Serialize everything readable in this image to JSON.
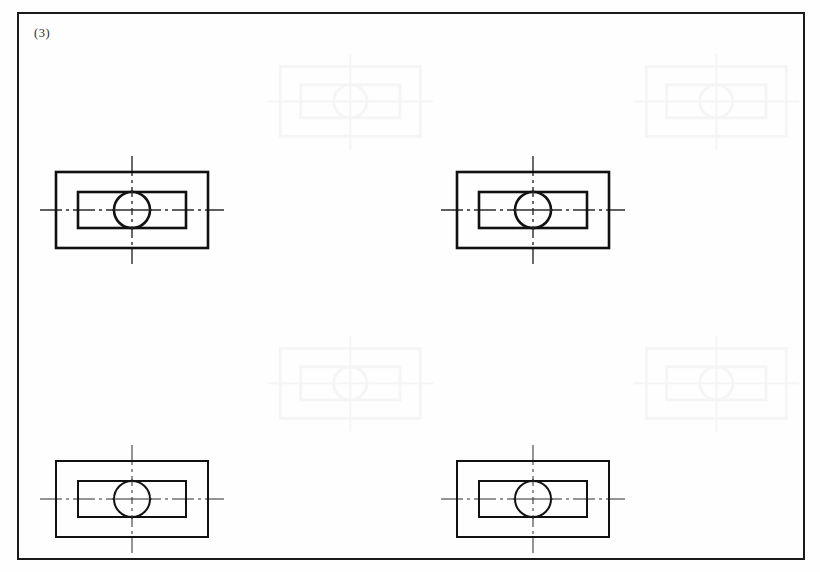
{
  "sheet": {
    "width": 820,
    "height": 572,
    "background_color": "#fefefe",
    "border_color": "#1a1a1a",
    "line_color": "#111111",
    "centerline_color": "#2b2b2b"
  },
  "figure_label": "(3)",
  "drawing": {
    "type": "orthographic-view",
    "description": "Four identical front views: outer rectangle, concentric inner rectangle, centered circle, horizontal and vertical dash-dot centerlines",
    "geometry": {
      "outer_rect": {
        "width": 152,
        "height": 76
      },
      "inner_rect": {
        "width": 108,
        "height": 36
      },
      "circle_radius": 18,
      "centerline_h_overhang": 16,
      "centerline_v_overhang": 16
    },
    "views": [
      {
        "name": "view-top-left",
        "position": "top-left",
        "x": 56,
        "y": 172,
        "center_x": 132,
        "center_y": 210,
        "stroke_width": 2.6
      },
      {
        "name": "view-top-right",
        "position": "top-right",
        "x": 457,
        "y": 172,
        "center_x": 533,
        "center_y": 210,
        "stroke_width": 2.6
      },
      {
        "name": "view-bottom-left",
        "position": "bottom-left",
        "x": 56,
        "y": 461,
        "center_x": 132,
        "center_y": 499,
        "stroke_width": 2.0
      },
      {
        "name": "view-bottom-right",
        "position": "bottom-right",
        "x": 457,
        "y": 461,
        "center_x": 533,
        "center_y": 499,
        "stroke_width": 2.0
      }
    ],
    "ghosts": [
      {
        "name": "ghost-top-center",
        "x": 262,
        "y": 48,
        "scale": 0.92
      },
      {
        "name": "ghost-top-right",
        "x": 628,
        "y": 48,
        "scale": 0.92
      },
      {
        "name": "ghost-mid-left",
        "x": 262,
        "y": 330,
        "scale": 0.92
      },
      {
        "name": "ghost-mid-right",
        "x": 628,
        "y": 330,
        "scale": 0.92
      }
    ]
  }
}
